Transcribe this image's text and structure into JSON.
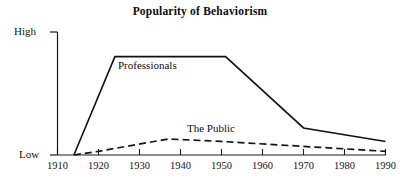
{
  "chart_data": {
    "type": "line",
    "title": "Popularity of Behaviorism",
    "xlabel": "",
    "ylabel": "",
    "xlim": [
      1910,
      1990
    ],
    "ylim": [
      0,
      100
    ],
    "grid": false,
    "legend": "inline-labels",
    "x_ticks": [
      1910,
      1920,
      1930,
      1940,
      1950,
      1960,
      1970,
      1980,
      1990
    ],
    "x_tick_labels": [
      "1910",
      "1920",
      "1930",
      "1940",
      "1950",
      "1960",
      "1970",
      "1980",
      "1990"
    ],
    "y_ticks": [
      0,
      100
    ],
    "y_tick_labels": [
      "Low",
      "High"
    ],
    "series": [
      {
        "name": "Professionals",
        "style": "solid",
        "x": [
          1914,
          1924,
          1951,
          1970,
          1990
        ],
        "values": [
          0,
          80,
          80,
          22,
          11
        ]
      },
      {
        "name": "The Public",
        "style": "dashed",
        "x": [
          1914,
          1920,
          1937,
          1950,
          1970,
          1990
        ],
        "values": [
          0,
          3,
          13,
          11,
          7,
          3
        ]
      }
    ]
  },
  "axes": {
    "y_high_label": "High",
    "y_low_label": "Low"
  },
  "series_labels": {
    "professionals": "Professionals",
    "public": "The Public"
  },
  "artifact": {
    "watermark_text": ""
  },
  "colors": {
    "background": "#ffffff",
    "axis": "#1a1a1a",
    "professionals_line": "#111111",
    "public_line": "#151515",
    "text": "#141414"
  }
}
